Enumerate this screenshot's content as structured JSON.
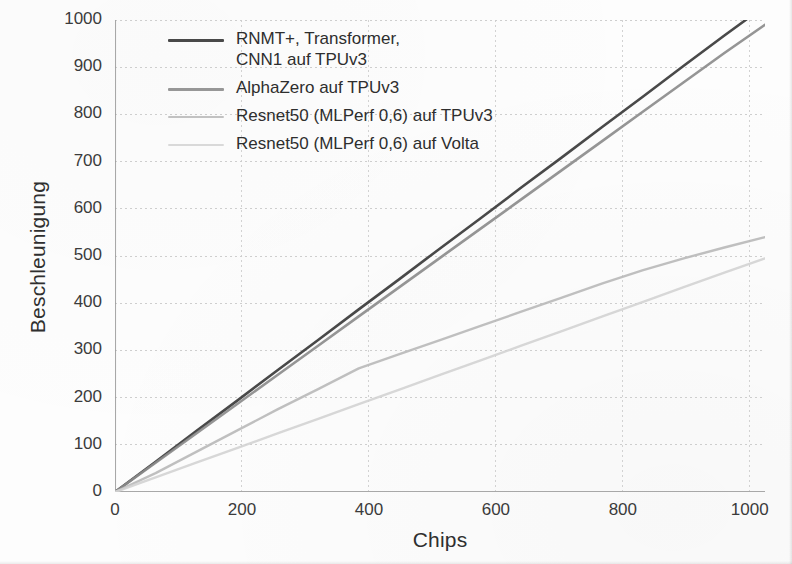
{
  "figure": {
    "y_axis_title": "Beschleunigung",
    "x_axis_title": "Chips"
  },
  "legend": {
    "entries": [
      {
        "label": "RNMT+, Transformer,\nCNN1 auf TPUv3",
        "color": "#3f3f3f"
      },
      {
        "label": "AlphaZero auf TPUv3",
        "color": "#8c8c8c"
      },
      {
        "label": "Resnet50 (MLPerf 0,6) auf TPUv3",
        "color": "#b7b7b7"
      },
      {
        "label": "Resnet50 (MLPerf 0,6) auf Volta",
        "color": "#d2d2d2"
      }
    ]
  },
  "axes": {
    "y_ticks": [
      "0",
      "100",
      "200",
      "300",
      "400",
      "500",
      "600",
      "700",
      "800",
      "900",
      "1000"
    ],
    "x_ticks": [
      "0",
      "200",
      "400",
      "600",
      "800",
      "1000"
    ]
  },
  "chart_data": {
    "type": "line",
    "title": "",
    "xlabel": "Chips",
    "ylabel": "Beschleunigung",
    "xlim": [
      0,
      1024
    ],
    "ylim": [
      0,
      1000
    ],
    "grid": true,
    "legend_position": "top-left-inside",
    "x": [
      0,
      64,
      128,
      192,
      256,
      320,
      384,
      448,
      512,
      576,
      640,
      704,
      768,
      832,
      896,
      960,
      1024
    ],
    "series": [
      {
        "name": "RNMT+, Transformer, CNN1 auf TPUv3",
        "color": "#3f3f3f",
        "values": [
          0,
          64,
          129,
          193,
          258,
          322,
          387,
          451,
          516,
          580,
          645,
          709,
          774,
          838,
          903,
          967,
          1030
        ]
      },
      {
        "name": "AlphaZero auf TPUv3",
        "color": "#8c8c8c",
        "values": [
          0,
          62,
          124,
          186,
          248,
          310,
          372,
          434,
          496,
          558,
          620,
          682,
          744,
          806,
          868,
          930,
          990
        ]
      },
      {
        "name": "Resnet50 (MLPerf 0,6) auf TPUv3",
        "color": "#b7b7b7",
        "values": [
          0,
          40,
          85,
          130,
          175,
          218,
          262,
          292,
          322,
          352,
          382,
          412,
          442,
          470,
          495,
          518,
          540
        ]
      },
      {
        "name": "Resnet50 (MLPerf 0,6) auf Volta",
        "color": "#d2d2d2",
        "values": [
          0,
          31,
          62,
          93,
          124,
          155,
          186,
          217,
          248,
          279,
          310,
          341,
          372,
          403,
          434,
          465,
          495
        ]
      }
    ]
  }
}
